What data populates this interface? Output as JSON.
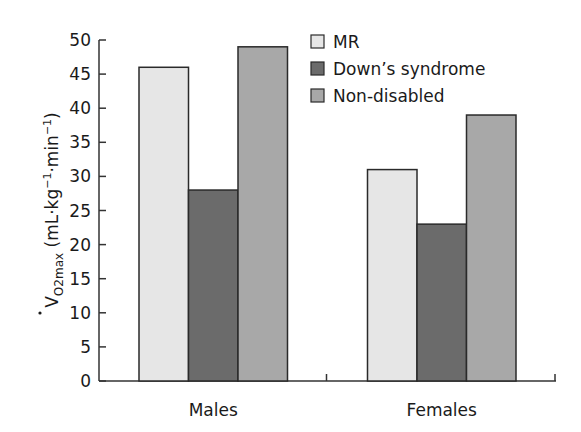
{
  "chart_data": {
    "type": "bar",
    "title": "",
    "xlabel": "",
    "ylabel": "V̇O2max (mL·kg⁻¹·min⁻¹)",
    "ylabel_parts": {
      "main": "V",
      "sub": "O2max",
      "units": " (mL·kg",
      "exp1": "−1",
      "mid": "·min",
      "exp2": "−1",
      "end": ")"
    },
    "ylim": [
      0,
      50
    ],
    "yticks": [
      0,
      5,
      10,
      15,
      20,
      25,
      30,
      35,
      40,
      45,
      50
    ],
    "categories": [
      "Males",
      "Females"
    ],
    "series": [
      {
        "name": "MR",
        "values": [
          46,
          31
        ],
        "color": "#e6e6e6"
      },
      {
        "name": "Down’s syndrome",
        "values": [
          28,
          23
        ],
        "color": "#6b6b6b"
      },
      {
        "name": "Non-disabled",
        "values": [
          49,
          39
        ],
        "color": "#a8a8a8"
      }
    ],
    "grid": false,
    "legend_position": "upper right"
  }
}
